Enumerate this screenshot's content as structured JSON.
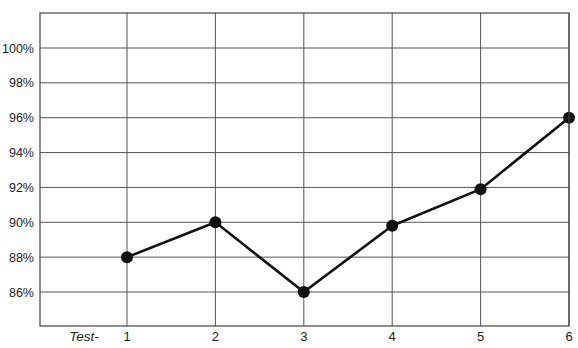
{
  "chart_data": {
    "type": "line",
    "title": "",
    "xlabel": "Test-",
    "ylabel": "",
    "categories": [
      "1",
      "2",
      "3",
      "4",
      "5",
      "6"
    ],
    "series": [
      {
        "name": "Score",
        "values": [
          88,
          90,
          86,
          89.8,
          91.9,
          96
        ]
      }
    ],
    "yticks": [
      "86%",
      "88%",
      "90%",
      "92%",
      "94%",
      "96%",
      "98%",
      "100%"
    ],
    "ylim": [
      84,
      102
    ],
    "grid": true,
    "legend": "none",
    "colors": {
      "line": "#111111",
      "grid": "#555555",
      "text": "#222222"
    }
  }
}
